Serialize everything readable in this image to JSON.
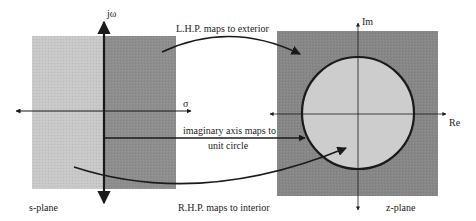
{
  "s_plane": {
    "label": "s-plane",
    "vertical_axis_label": "jω",
    "horizontal_axis_label": "σ",
    "left_region_color": "#c9c9c9",
    "right_region_color": "#8e8e8e"
  },
  "z_plane": {
    "label": "z-plane",
    "vertical_axis_label": "Im",
    "horizontal_axis_label": "Re",
    "exterior_color": "#878787",
    "interior_color": "#cdcdcd"
  },
  "mappings": {
    "lhp": "L.H.P. maps to exterior",
    "imag_axis_line1": "imaginary axis maps to",
    "imag_axis_line2": "unit circle",
    "rhp": "R.H.P. maps to interior"
  },
  "colors": {
    "ink": "#1a1a1a",
    "background": "#ffffff"
  }
}
